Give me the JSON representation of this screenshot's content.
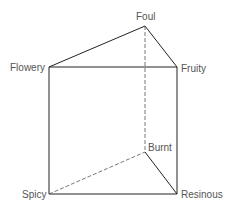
{
  "diagram": {
    "type": "triangular-prism",
    "labels": {
      "foul": "Foul",
      "flowery": "Flowery",
      "fruity": "Fruity",
      "burnt": "Burnt",
      "spicy": "Spicy",
      "resinous": "Resinous"
    },
    "colors": {
      "edge": "#222222",
      "hidden_edge": "#555555",
      "label": "#555555"
    }
  }
}
